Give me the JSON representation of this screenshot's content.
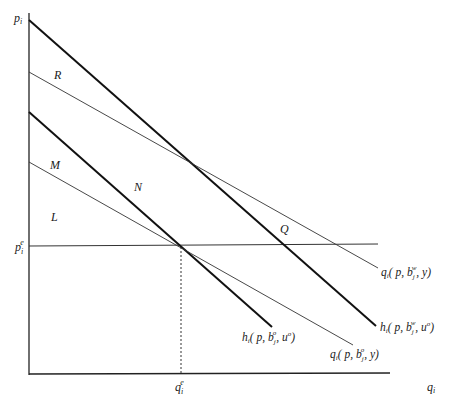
{
  "diagram": {
    "type": "economics-demand-curves",
    "axes": {
      "y_label_main": "p",
      "y_label_sub": "i",
      "x_label_main": "q",
      "x_label_sub": "i"
    },
    "equilibrium": {
      "price_main": "p",
      "price_sub": "i",
      "price_sup": "e",
      "quantity_main": "q",
      "quantity_sub": "i",
      "quantity_sup": "e"
    },
    "regions": {
      "R": "R",
      "M": "M",
      "N": "N",
      "L": "L",
      "Q": "Q"
    },
    "curves": [
      {
        "id": "q-w",
        "style": "thin",
        "label": "qᵢ( p, bⱼʷ, y)",
        "parts": {
          "fn": "q",
          "sub": "i",
          "args_open": "( p, b",
          "b_sup": "w",
          "b_sub": "j",
          "args_close": ", y)"
        }
      },
      {
        "id": "h-w",
        "style": "thick",
        "label": "hᵢ( p, bⱼʷ, uᵒ)",
        "parts": {
          "fn": "h",
          "sub": "i",
          "args_open": "( p, b",
          "b_sup": "w",
          "b_sub": "j",
          "args_mid": ", u",
          "u_sup": "o",
          "args_close": ")"
        }
      },
      {
        "id": "h-o",
        "style": "thick",
        "label": "hᵢ( p, bⱼᵒ, uᵒ)",
        "parts": {
          "fn": "h",
          "sub": "i",
          "args_open": "( p, b",
          "b_sup": "o",
          "b_sub": "j",
          "args_mid": ", u",
          "u_sup": "o",
          "args_close": ")"
        }
      },
      {
        "id": "q-o",
        "style": "thin",
        "label": "qᵢ( p, bⱼᵒ, y)",
        "parts": {
          "fn": "q",
          "sub": "i",
          "args_open": "( p, b",
          "b_sup": "o",
          "b_sub": "j",
          "args_close": ", y)"
        }
      }
    ]
  }
}
